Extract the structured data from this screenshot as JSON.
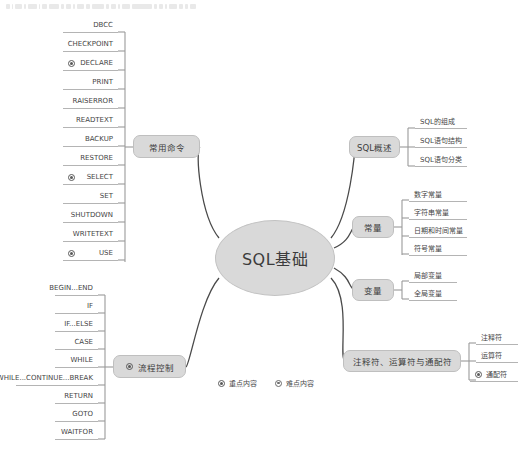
{
  "mindmap": {
    "central": {
      "label": "SQL基础"
    },
    "branches": [
      {
        "id": "changyong-mingling",
        "label": "常用命令",
        "side": "left",
        "children": [
          {
            "label": "DBCC",
            "marker": null
          },
          {
            "label": "CHECKPOINT",
            "marker": null
          },
          {
            "label": "DECLARE",
            "marker": "key"
          },
          {
            "label": "PRINT",
            "marker": null
          },
          {
            "label": "RAISERROR",
            "marker": null
          },
          {
            "label": "READTEXT",
            "marker": null
          },
          {
            "label": "BACKUP",
            "marker": null
          },
          {
            "label": "RESTORE",
            "marker": null
          },
          {
            "label": "SELECT",
            "marker": "key"
          },
          {
            "label": "SET",
            "marker": null
          },
          {
            "label": "SHUTDOWN",
            "marker": null
          },
          {
            "label": "WRITETEXT",
            "marker": null
          },
          {
            "label": "USE",
            "marker": "key"
          }
        ]
      },
      {
        "id": "liucheng-kongzhi",
        "label": "流程控制",
        "marker": "key",
        "side": "left",
        "children": [
          {
            "label": "BEGIN...END",
            "marker": null
          },
          {
            "label": "IF",
            "marker": null
          },
          {
            "label": "IF...ELSE",
            "marker": null
          },
          {
            "label": "CASE",
            "marker": null
          },
          {
            "label": "WHILE",
            "marker": null
          },
          {
            "label": "WHILE...CONTINUE...BREAK",
            "marker": null
          },
          {
            "label": "RETURN",
            "marker": null
          },
          {
            "label": "GOTO",
            "marker": null
          },
          {
            "label": "WAITFOR",
            "marker": null
          }
        ]
      },
      {
        "id": "sql-gaishu",
        "label": "SQL概述",
        "side": "right",
        "children": [
          {
            "label": "SQL的组成",
            "marker": null
          },
          {
            "label": "SQL语句结构",
            "marker": null
          },
          {
            "label": "SQL语句分类",
            "marker": null
          }
        ]
      },
      {
        "id": "changliang",
        "label": "常量",
        "side": "right",
        "children": [
          {
            "label": "数字常量",
            "marker": null
          },
          {
            "label": "字符串常量",
            "marker": null
          },
          {
            "label": "日期和时间常量",
            "marker": null
          },
          {
            "label": "符号常量",
            "marker": null
          }
        ]
      },
      {
        "id": "bianliang",
        "label": "变量",
        "side": "right",
        "children": [
          {
            "label": "局部变量",
            "marker": null
          },
          {
            "label": "全局变量",
            "marker": null
          }
        ]
      },
      {
        "id": "fuhao",
        "label": "注释符、运算符与通配符",
        "side": "right",
        "children": [
          {
            "label": "注释符",
            "marker": null
          },
          {
            "label": "运算符",
            "marker": null
          },
          {
            "label": "通配符",
            "marker": "key"
          }
        ]
      }
    ],
    "legend": [
      {
        "label": "重点内容",
        "marker": "key"
      },
      {
        "label": "难点内容",
        "marker": "hard"
      }
    ]
  },
  "colors": {
    "node_fill": "#d9d9d9",
    "node_border": "#bfbfbf",
    "line": "#4a4a4a",
    "text": "#3c3c3c"
  }
}
